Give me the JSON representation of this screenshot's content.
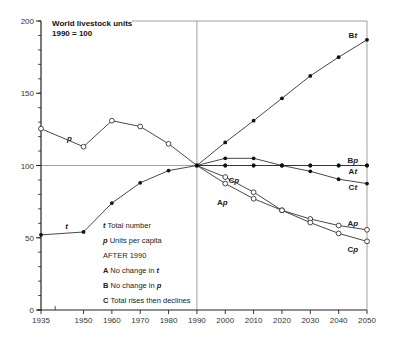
{
  "chart_data": {
    "type": "line",
    "title": "World livestock units",
    "subtitle": "1990 = 100",
    "xlabel": "",
    "ylabel": "",
    "xlim": [
      1935,
      2050
    ],
    "ylim": [
      0,
      200
    ],
    "x_ticks": [
      1935,
      1950,
      1960,
      1970,
      1980,
      1990,
      2000,
      2010,
      2020,
      2030,
      2040,
      2050
    ],
    "y_ticks": [
      0,
      50,
      100,
      150,
      200
    ],
    "y_minor_step": 10,
    "grid": false,
    "reference_lines": {
      "horizontal_at": 100,
      "vertical_at": 1990
    },
    "series": [
      {
        "name": "t",
        "label": "t",
        "marker": "filled",
        "x": [
          1935,
          1950,
          1960,
          1970,
          1980,
          1990
        ],
        "values": [
          52,
          54,
          74,
          88,
          96.5,
          100
        ]
      },
      {
        "name": "p",
        "label": "p",
        "marker": "open",
        "x": [
          1935,
          1950,
          1960,
          1970,
          1980,
          1990
        ],
        "values": [
          125.5,
          113,
          131,
          127,
          115,
          100
        ]
      },
      {
        "name": "Bt",
        "label": "Bt",
        "marker": "filled",
        "x": [
          1990,
          2000,
          2010,
          2020,
          2030,
          2040,
          2050
        ],
        "values": [
          100,
          116,
          131,
          146.5,
          162,
          175,
          187
        ]
      },
      {
        "name": "Bp",
        "label": "Bp",
        "marker": "filled",
        "x": [
          1990,
          2000,
          2010,
          2020,
          2030,
          2040,
          2050
        ],
        "values": [
          100,
          100,
          100,
          100,
          100,
          100,
          100
        ]
      },
      {
        "name": "At",
        "label": "At",
        "marker": "filled",
        "x": [
          1990,
          2000,
          2010,
          2020,
          2030,
          2040,
          2050
        ],
        "values": [
          100,
          100,
          100,
          100,
          100,
          100,
          100
        ]
      },
      {
        "name": "Ct",
        "label": "Ct",
        "marker": "filled",
        "x": [
          1990,
          2000,
          2010,
          2020,
          2030,
          2040,
          2050
        ],
        "values": [
          100,
          105,
          105,
          100,
          96,
          90.5,
          87.5
        ]
      },
      {
        "name": "Ap",
        "label": "Ap",
        "marker": "open",
        "x": [
          1990,
          2000,
          2010,
          2020,
          2030,
          2040,
          2050
        ],
        "values": [
          100,
          87.5,
          77,
          69,
          63,
          58.5,
          55.5
        ]
      },
      {
        "name": "Cp",
        "label": "Cp",
        "marker": "open",
        "x": [
          1990,
          2000,
          2010,
          2020,
          2030,
          2040,
          2050
        ],
        "values": [
          100,
          92,
          81.5,
          69,
          60.5,
          53,
          47.5
        ]
      }
    ],
    "series_labels": [
      {
        "key": "p",
        "prefix": "",
        "ital": "p",
        "x": 1945,
        "y": 117
      },
      {
        "key": "t",
        "prefix": "",
        "ital": "t",
        "x": 1944,
        "y": 56
      },
      {
        "key": "Bt",
        "prefix": "B",
        "ital": "t",
        "x": 2045,
        "y": 188
      },
      {
        "key": "Bp",
        "prefix": "B",
        "ital": "p",
        "x": 2045,
        "y": 102
      },
      {
        "key": "At",
        "prefix": "A",
        "ital": "t",
        "x": 2045,
        "y": 94
      },
      {
        "key": "Ct",
        "prefix": "C",
        "ital": "t",
        "x": 2045,
        "y": 83
      },
      {
        "key": "Cp-upper",
        "prefix": "C",
        "ital": "p",
        "x": 2003,
        "y": 88
      },
      {
        "key": "Ap-upper",
        "prefix": "A",
        "ital": "p",
        "x": 1999,
        "y": 73
      },
      {
        "key": "Ap-lower",
        "prefix": "A",
        "ital": "p",
        "x": 2045,
        "y": 58
      },
      {
        "key": "Cp-lower",
        "prefix": "C",
        "ital": "p",
        "x": 2045,
        "y": 40
      }
    ],
    "legend": {
      "position": "inside-lower-left",
      "entries": [
        {
          "key": "t",
          "key_style": "italic",
          "text": "Total number"
        },
        {
          "key": "p",
          "key_style": "italic",
          "text": "Units per capita"
        },
        {
          "key": "",
          "key_style": "none",
          "text": "AFTER 1990"
        },
        {
          "key": "A",
          "key_style": "bold",
          "text": "No change in ",
          "text_ital": "t"
        },
        {
          "key": "B",
          "key_style": "bold",
          "text": "No change in ",
          "text_ital": "p"
        },
        {
          "key": "C",
          "key_style": "bold",
          "text": "Total rises then declines"
        }
      ]
    }
  },
  "colors": {
    "line": "#333333",
    "axis": "#222222",
    "reference": "#888888",
    "background": "#ffffff"
  }
}
